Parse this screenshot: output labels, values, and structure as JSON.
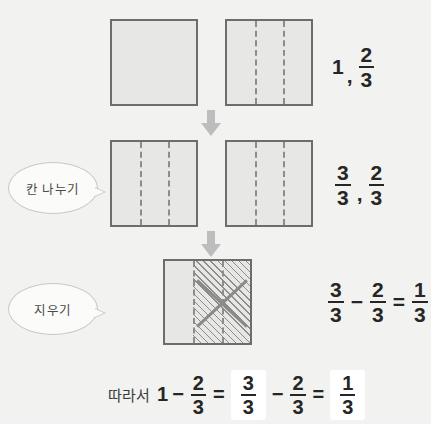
{
  "background_color": "#f2f2f0",
  "square_fill": "#e7e7e5",
  "square_border": "#6d6d6d",
  "arrow_color": "#bdbdbd",
  "rows": [
    {
      "id": "row-1",
      "label": "",
      "squares": [
        {
          "name": "whole-square",
          "divisions": 1,
          "hatched": false
        },
        {
          "name": "thirds-square",
          "divisions": 3,
          "hatched": false
        }
      ],
      "expression": {
        "whole": "1",
        "separator": ",",
        "fraction": {
          "numerator": "2",
          "denominator": "3"
        }
      }
    },
    {
      "id": "row-2",
      "label": "칸 나누기",
      "squares": [
        {
          "name": "thirds-square-left",
          "divisions": 3,
          "hatched": false
        },
        {
          "name": "thirds-square-right",
          "divisions": 3,
          "hatched": false
        }
      ],
      "expression": {
        "left_fraction": {
          "numerator": "3",
          "denominator": "3"
        },
        "separator": ",",
        "right_fraction": {
          "numerator": "2",
          "denominator": "3"
        }
      }
    },
    {
      "id": "row-3",
      "label": "지우기",
      "squares": [
        {
          "name": "result-square",
          "divisions": 3,
          "hatched": true,
          "hatched_parts": 2
        }
      ],
      "expression": {
        "left_fraction": {
          "numerator": "3",
          "denominator": "3"
        },
        "minus": "−",
        "right_fraction": {
          "numerator": "2",
          "denominator": "3"
        },
        "equals": "=",
        "result_fraction": {
          "numerator": "1",
          "denominator": "3"
        }
      }
    }
  ],
  "conclusion": {
    "lead": "따라서",
    "whole": "1",
    "minus_1": "−",
    "frac_a": {
      "numerator": "2",
      "denominator": "3"
    },
    "equals_1": "=",
    "frac_b_boxed": {
      "numerator": "3",
      "denominator": "3"
    },
    "minus_2": "−",
    "frac_c": {
      "numerator": "2",
      "denominator": "3"
    },
    "equals_2": "=",
    "frac_d_boxed": {
      "numerator": "1",
      "denominator": "3"
    }
  },
  "arrows": [
    {
      "name": "arrow-step-1",
      "direction": "down"
    },
    {
      "name": "arrow-step-2",
      "direction": "down"
    }
  ]
}
